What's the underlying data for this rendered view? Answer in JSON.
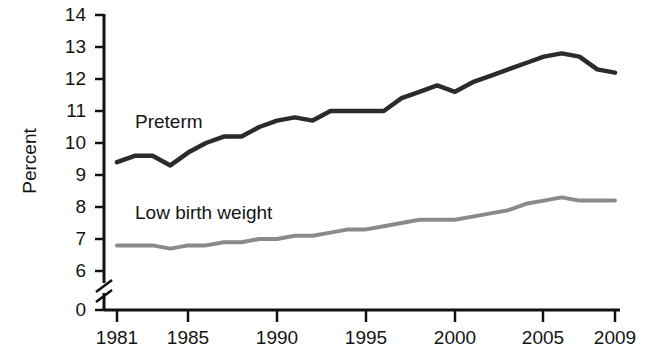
{
  "chart_data": {
    "type": "line",
    "title": "",
    "xlabel": "",
    "ylabel": "Percent",
    "xlim": [
      1981,
      2009
    ],
    "ylim": [
      6,
      14
    ],
    "y_axis_break": true,
    "y_break_between": [
      0,
      6
    ],
    "ytick_labels": [
      "14",
      "13",
      "12",
      "11",
      "10",
      "9",
      "8",
      "7",
      "6",
      "0"
    ],
    "ytick_values": [
      14,
      13,
      12,
      11,
      10,
      9,
      8,
      7,
      6,
      0
    ],
    "xtick_labels": [
      "1981",
      "1985",
      "1990",
      "1995",
      "2000",
      "2005",
      "2009"
    ],
    "xtick_values": [
      1981,
      1985,
      1990,
      1995,
      2000,
      2005,
      2009
    ],
    "grid": false,
    "legend_position": "inline-annotation",
    "x": [
      1981,
      1982,
      1983,
      1984,
      1985,
      1986,
      1987,
      1988,
      1989,
      1990,
      1991,
      1992,
      1993,
      1994,
      1995,
      1996,
      1997,
      1998,
      1999,
      2000,
      2001,
      2002,
      2003,
      2004,
      2005,
      2006,
      2007,
      2008,
      2009
    ],
    "series": [
      {
        "name": "Preterm",
        "color": "#2b2b2b",
        "label_x": 135,
        "label_y": 112,
        "values": [
          9.4,
          9.6,
          9.6,
          9.3,
          9.7,
          10.0,
          10.2,
          10.2,
          10.5,
          10.7,
          10.8,
          10.7,
          11.0,
          11.0,
          11.0,
          11.0,
          11.4,
          11.6,
          11.8,
          11.6,
          11.9,
          12.1,
          12.3,
          12.5,
          12.7,
          12.8,
          12.7,
          12.3,
          12.2
        ]
      },
      {
        "name": "Low birth weight",
        "color": "#8a8a8a",
        "label_x": 135,
        "label_y": 203,
        "values": [
          6.8,
          6.8,
          6.8,
          6.7,
          6.8,
          6.8,
          6.9,
          6.9,
          7.0,
          7.0,
          7.1,
          7.1,
          7.2,
          7.3,
          7.3,
          7.4,
          7.5,
          7.6,
          7.6,
          7.6,
          7.7,
          7.8,
          7.9,
          8.1,
          8.2,
          8.3,
          8.2,
          8.2,
          8.2
        ]
      }
    ]
  },
  "axis": {
    "ylabel_text": "Percent"
  }
}
